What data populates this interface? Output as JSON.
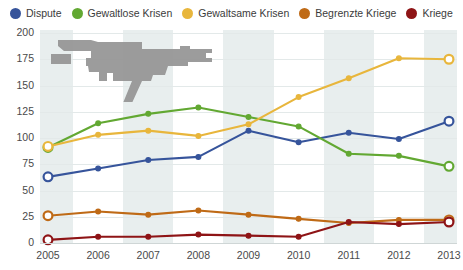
{
  "legend": {
    "position": "top",
    "items": [
      {
        "label": "Dispute",
        "color": "#36549b",
        "icon": "circle-marker-icon"
      },
      {
        "label": "Gewaltlose Krisen",
        "color": "#62a832",
        "icon": "circle-marker-icon"
      },
      {
        "label": "Gewaltsame Krisen",
        "color": "#e8b63c",
        "icon": "circle-marker-icon"
      },
      {
        "label": "Begrenzte Kriege",
        "color": "#bf6a16",
        "icon": "circle-marker-icon"
      },
      {
        "label": "Kriege",
        "color": "#8e1416",
        "icon": "circle-marker-icon"
      }
    ]
  },
  "watermark": {
    "name": "assault-rifle-silhouette",
    "color": "#9b9b9b"
  },
  "axes": {
    "y_ticks": [
      "0",
      "25",
      "50",
      "75",
      "100",
      "125",
      "150",
      "175",
      "200"
    ],
    "x_ticks": [
      "2005",
      "2006",
      "2007",
      "2008",
      "2009",
      "2010",
      "2011",
      "2012",
      "2013"
    ]
  },
  "chart_data": {
    "type": "line",
    "title": "",
    "subtitle": "",
    "xlabel": "",
    "ylabel": "",
    "categories": [
      "2005",
      "2006",
      "2007",
      "2008",
      "2009",
      "2010",
      "2011",
      "2012",
      "2013"
    ],
    "x": [
      2005,
      2006,
      2007,
      2008,
      2009,
      2010,
      2011,
      2012,
      2013
    ],
    "ylim": [
      0,
      200
    ],
    "xlim": [
      2005,
      2013
    ],
    "ytick_step": 25,
    "grid": true,
    "legend_position": "top",
    "series": [
      {
        "name": "Dispute",
        "color": "#36549b",
        "values": [
          63,
          71,
          79,
          82,
          107,
          96,
          105,
          99,
          116
        ]
      },
      {
        "name": "Gewaltlose Krisen",
        "color": "#62a832",
        "values": [
          91,
          114,
          123,
          129,
          120,
          111,
          85,
          83,
          73
        ]
      },
      {
        "name": "Gewaltsame Krisen",
        "color": "#e8b63c",
        "values": [
          92,
          103,
          107,
          102,
          113,
          139,
          157,
          176,
          175
        ]
      },
      {
        "name": "Begrenzte Kriege",
        "color": "#bf6a16",
        "values": [
          26,
          30,
          27,
          31,
          27,
          23,
          19,
          22,
          22
        ]
      },
      {
        "name": "Kriege",
        "color": "#8e1416",
        "values": [
          3,
          6,
          6,
          8,
          7,
          6,
          20,
          18,
          20
        ]
      }
    ]
  }
}
